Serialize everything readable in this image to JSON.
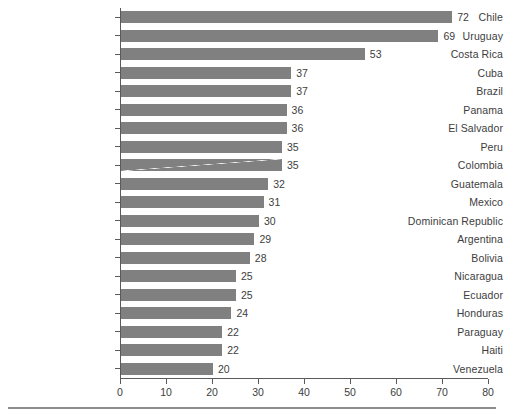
{
  "chart_data": {
    "type": "bar",
    "orientation": "horizontal",
    "title": "",
    "subtitle": "",
    "xlabel": "",
    "ylabel": "",
    "xlim": [
      0,
      80
    ],
    "xticks": [
      0,
      10,
      20,
      30,
      40,
      50,
      60,
      70,
      80
    ],
    "grid": false,
    "legend": null,
    "bar_color": "#808080",
    "axis_color": "#5a5a5a",
    "background_color": "#ffffff",
    "show_value_labels": true,
    "categories": [
      "Chile",
      "Uruguay",
      "Costa Rica",
      "Cuba",
      "Brazil",
      "Panama",
      "El Salvador",
      "Peru",
      "Colombia",
      "Guatemala",
      "Mexico",
      "Dominican Republic",
      "Argentina",
      "Bolivia",
      "Nicaragua",
      "Ecuador",
      "Honduras",
      "Paraguay",
      "Haiti",
      "Venezuela"
    ],
    "values": [
      72,
      69,
      53,
      37,
      37,
      36,
      36,
      35,
      35,
      32,
      31,
      30,
      29,
      28,
      25,
      25,
      24,
      22,
      22,
      20
    ],
    "value_labels": [
      "72",
      "69",
      "53",
      "37",
      "37",
      "36",
      "36",
      "35",
      "35",
      "32",
      "31",
      "30",
      "29",
      "28",
      "25",
      "25",
      "24",
      "22",
      "22",
      "20"
    ],
    "xtick_labels": [
      "0",
      "10",
      "20",
      "30",
      "40",
      "50",
      "60",
      "70",
      "80"
    ]
  }
}
